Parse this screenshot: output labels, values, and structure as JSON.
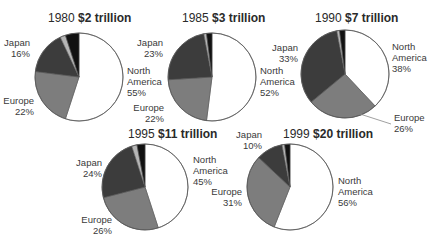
{
  "chart_data": [
    {
      "type": "pie",
      "year": "1980",
      "title_year": "1980",
      "title_value": "$2 trillion",
      "total_trillion": 2,
      "slices": [
        {
          "name": "North America",
          "value": 55,
          "label": "55%",
          "color": "#ffffff"
        },
        {
          "name": "Europe",
          "value": 22,
          "label": "22%",
          "color": "#7d7d7d"
        },
        {
          "name": "Japan",
          "value": 16,
          "label": "16%",
          "color": "#3c3c3c"
        },
        {
          "name": "Other (light)",
          "value": 2,
          "label": "",
          "color": "#b5b5b5"
        },
        {
          "name": "Other (dark)",
          "value": 5,
          "label": "",
          "color": "#111111"
        }
      ]
    },
    {
      "type": "pie",
      "year": "1985",
      "title_year": "1985",
      "title_value": "$3 trillion",
      "total_trillion": 3,
      "slices": [
        {
          "name": "North America",
          "value": 52,
          "label": "52%",
          "color": "#ffffff"
        },
        {
          "name": "Europe",
          "value": 22,
          "label": "22%",
          "color": "#7d7d7d"
        },
        {
          "name": "Japan",
          "value": 23,
          "label": "23%",
          "color": "#3c3c3c"
        },
        {
          "name": "Other (light)",
          "value": 1,
          "label": "",
          "color": "#b5b5b5"
        },
        {
          "name": "Other (dark)",
          "value": 2,
          "label": "",
          "color": "#111111"
        }
      ]
    },
    {
      "type": "pie",
      "year": "1990",
      "title_year": "1990",
      "title_value": "$7 trillion",
      "total_trillion": 7,
      "slices": [
        {
          "name": "North America",
          "value": 38,
          "label": "38%",
          "color": "#ffffff"
        },
        {
          "name": "Europe",
          "value": 26,
          "label": "26%",
          "color": "#7d7d7d"
        },
        {
          "name": "Japan",
          "value": 33,
          "label": "33%",
          "color": "#3c3c3c"
        },
        {
          "name": "Other (light)",
          "value": 1,
          "label": "",
          "color": "#b5b5b5"
        },
        {
          "name": "Other (dark)",
          "value": 2,
          "label": "",
          "color": "#111111"
        }
      ]
    },
    {
      "type": "pie",
      "year": "1995",
      "title_year": "1995",
      "title_value": "$11 trillion",
      "total_trillion": 11,
      "slices": [
        {
          "name": "North America",
          "value": 45,
          "label": "45%",
          "color": "#ffffff"
        },
        {
          "name": "Europe",
          "value": 26,
          "label": "26%",
          "color": "#7d7d7d"
        },
        {
          "name": "Japan",
          "value": 24,
          "label": "24%",
          "color": "#3c3c3c"
        },
        {
          "name": "Other (light)",
          "value": 2,
          "label": "",
          "color": "#b5b5b5"
        },
        {
          "name": "Other (dark)",
          "value": 3,
          "label": "",
          "color": "#111111"
        }
      ]
    },
    {
      "type": "pie",
      "year": "1999",
      "title_year": "1999",
      "title_value": "$20 trillion",
      "total_trillion": 20,
      "slices": [
        {
          "name": "North America",
          "value": 56,
          "label": "56%",
          "color": "#ffffff"
        },
        {
          "name": "Europe",
          "value": 31,
          "label": "31%",
          "color": "#7d7d7d"
        },
        {
          "name": "Japan",
          "value": 10,
          "label": "10%",
          "color": "#3c3c3c"
        },
        {
          "name": "Other (light)",
          "value": 1,
          "label": "",
          "color": "#b5b5b5"
        },
        {
          "name": "Other (dark)",
          "value": 2,
          "label": "",
          "color": "#111111"
        }
      ]
    }
  ],
  "labels": {
    "north": "North",
    "america": "America",
    "europe": "Europe",
    "japan": "Japan"
  },
  "layout": [
    {
      "cx": 79,
      "cy": 77,
      "r": 44,
      "title_x": 48,
      "title_y": 22,
      "japan": {
        "x": 30,
        "y": 46,
        "anchor": "end"
      },
      "na": {
        "x": 127,
        "y": 74,
        "anchor": "start"
      },
      "europe": {
        "x": 34,
        "y": 104,
        "anchor": "end"
      }
    },
    {
      "cx": 212,
      "cy": 77,
      "r": 44,
      "title_x": 182,
      "title_y": 22,
      "japan": {
        "x": 163,
        "y": 46,
        "anchor": "end"
      },
      "na": {
        "x": 260,
        "y": 74,
        "anchor": "start"
      },
      "europe": {
        "x": 164,
        "y": 111,
        "anchor": "end"
      }
    },
    {
      "cx": 345,
      "cy": 74,
      "r": 44,
      "title_x": 315,
      "title_y": 22,
      "japan": {
        "x": 298,
        "y": 51,
        "anchor": "end"
      },
      "na": {
        "x": 392,
        "y": 50,
        "anchor": "start"
      },
      "europe": {
        "x": 394,
        "y": 121,
        "anchor": "start"
      }
    },
    {
      "cx": 145,
      "cy": 187,
      "r": 43,
      "title_x": 128,
      "title_y": 138,
      "japan": {
        "x": 102,
        "y": 166,
        "anchor": "end"
      },
      "na": {
        "x": 193,
        "y": 163,
        "anchor": "start"
      },
      "europe": {
        "x": 112,
        "y": 223,
        "anchor": "end"
      }
    },
    {
      "cx": 290,
      "cy": 187,
      "r": 43,
      "title_x": 283,
      "title_y": 138,
      "japan": {
        "x": 262,
        "y": 138,
        "anchor": "end"
      },
      "na": {
        "x": 338,
        "y": 184,
        "anchor": "start"
      },
      "europe": {
        "x": 242,
        "y": 195,
        "anchor": "end"
      }
    }
  ]
}
